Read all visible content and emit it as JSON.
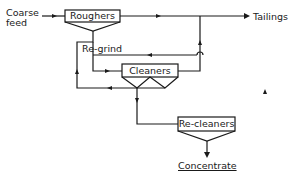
{
  "diagram": {
    "inputs": {
      "feed_line1": "Coarse",
      "feed_line2": "feed"
    },
    "units": {
      "roughers": "Roughers",
      "cleaners": "Cleaners",
      "recleaners": "Re-cleaners"
    },
    "streams": {
      "regrind": "Re-grind",
      "tailings": "Tailings",
      "concentrate": "Concentrate"
    },
    "colors": {
      "line": "#1a1a1a",
      "background": "#ffffff"
    }
  }
}
